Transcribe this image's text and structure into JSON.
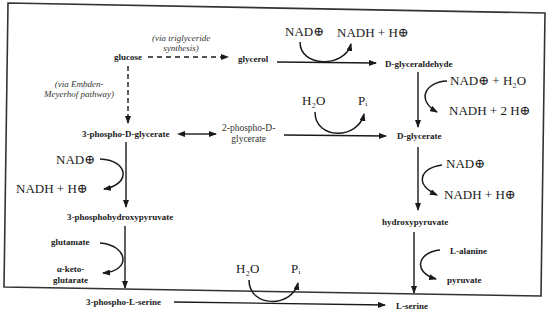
{
  "diagram": {
    "type": "metabolic-pathway",
    "title": "",
    "nodes": {
      "glucose": "glucose",
      "glycerol": "glycerol",
      "d_glyceraldehyde": "D-glyceraldehyde",
      "three_phospho_d_glycerate": "3-phospho-D-glycerate",
      "two_phospho_d_glycerate_line1": "2-phospho-D-",
      "two_phospho_d_glycerate_line2": "glycerate",
      "d_glycerate": "D-glycerate",
      "three_phosphohydroxypyruvate": "3-phosphohydroxypyruvate",
      "hydroxypyruvate": "hydroxypyruvate",
      "three_phospho_l_serine": "3-phospho-L-serine",
      "l_serine": "L-serine"
    },
    "annotations": {
      "triglyceride_line1": "(via triglyceride",
      "triglyceride_line2": "synthesis)",
      "embden_line1": "(via Embden-",
      "embden_line2": "Meyerhof pathway)"
    },
    "cofactors": {
      "glycerol_to_glyceraldehyde": {
        "in": "NAD⊕",
        "out": "NADH + H⊕"
      },
      "glyceraldehyde_to_glycerate": {
        "in": "NAD⊕ + H₂O",
        "out": "NADH + 2 H⊕"
      },
      "phosphoglycerate_to_glycerate": {
        "in": "H₂O",
        "out": "Pᵢ"
      },
      "glycerate_to_hydroxypyruvate": {
        "in": "NAD⊕",
        "out": "NADH + H⊕"
      },
      "phosphoglycerate_to_phosphohydroxypyruvate": {
        "in": "NAD⊕",
        "out": "NADH + H⊕"
      },
      "phosphohydroxypyruvate_to_phosphoserine": {
        "in": "glutamate",
        "out_line1": "α-keto-",
        "out_line2": "glutarate"
      },
      "hydroxypyruvate_to_serine": {
        "in": "L-alanine",
        "out": "pyruvate"
      },
      "phosphoserine_to_serine": {
        "in": "H₂O",
        "out": "Pᵢ"
      }
    },
    "edges": [
      {
        "from": "glucose",
        "to": "glycerol",
        "style": "dashed"
      },
      {
        "from": "glucose",
        "to": "3-phospho-D-glycerate",
        "style": "dashed"
      },
      {
        "from": "glycerol",
        "to": "D-glyceraldehyde",
        "style": "solid"
      },
      {
        "from": "D-glyceraldehyde",
        "to": "D-glycerate",
        "style": "solid"
      },
      {
        "from": "3-phospho-D-glycerate",
        "to": "2-phospho-D-glycerate",
        "style": "double-headed"
      },
      {
        "from": "2-phospho-D-glycerate",
        "to": "D-glycerate",
        "style": "solid"
      },
      {
        "from": "3-phospho-D-glycerate",
        "to": "3-phosphohydroxypyruvate",
        "style": "solid"
      },
      {
        "from": "3-phosphohydroxypyruvate",
        "to": "3-phospho-L-serine",
        "style": "solid"
      },
      {
        "from": "D-glycerate",
        "to": "hydroxypyruvate",
        "style": "solid"
      },
      {
        "from": "hydroxypyruvate",
        "to": "L-serine",
        "style": "solid"
      },
      {
        "from": "3-phospho-L-serine",
        "to": "L-serine",
        "style": "solid"
      }
    ],
    "colors": {
      "ink": "#1a1a1a",
      "border": "#333333",
      "background": "#ffffff"
    }
  }
}
